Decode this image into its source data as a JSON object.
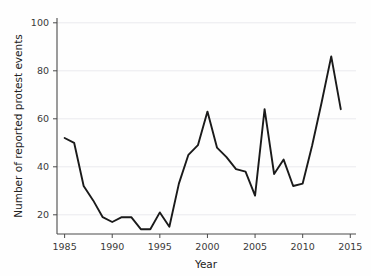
{
  "chart_data": {
    "type": "line",
    "title": "",
    "xlabel": "Year",
    "ylabel": "Number of reported protest events",
    "xlim": [
      1984.2,
      2015.6
    ],
    "ylim": [
      12,
      102
    ],
    "xticks": [
      1985,
      1990,
      1995,
      2000,
      2005,
      2010,
      2015
    ],
    "xtick_labels": [
      "1985",
      "1990",
      "1995",
      "2000",
      "2005",
      "2010",
      "2015"
    ],
    "yticks": [
      20,
      40,
      60,
      80,
      100
    ],
    "ytick_labels": [
      "20",
      "40",
      "60",
      "80",
      "100"
    ],
    "grid": "horizontal",
    "legend": "none",
    "line_color": "#1a1a1a",
    "grid_color": "#e9e9ec",
    "axis_color": "#4a4a4a",
    "background_color": "#fefefe",
    "x": [
      1985,
      1986,
      1987,
      1988,
      1989,
      1990,
      1991,
      1992,
      1993,
      1994,
      1995,
      1996,
      1997,
      1998,
      1999,
      2000,
      2001,
      2002,
      2003,
      2004,
      2005,
      2006,
      2007,
      2008,
      2009,
      2010,
      2011,
      2012,
      2013,
      2014
    ],
    "values": [
      52,
      50,
      32,
      26,
      19,
      17,
      19,
      19,
      14,
      14,
      21,
      15,
      33,
      45,
      49,
      63,
      48,
      44,
      39,
      38,
      28,
      64,
      37,
      43,
      32,
      33,
      49,
      67,
      86,
      64
    ],
    "series": [
      {
        "name": "Reported protest events",
        "values": [
          52,
          50,
          32,
          26,
          19,
          17,
          19,
          19,
          14,
          14,
          21,
          15,
          33,
          45,
          49,
          63,
          48,
          44,
          39,
          38,
          28,
          64,
          37,
          43,
          32,
          33,
          49,
          67,
          86,
          64
        ]
      }
    ],
    "annotations": []
  },
  "labels": {
    "x_axis_title": "Year",
    "y_axis_title": "Number of reported protest events"
  }
}
